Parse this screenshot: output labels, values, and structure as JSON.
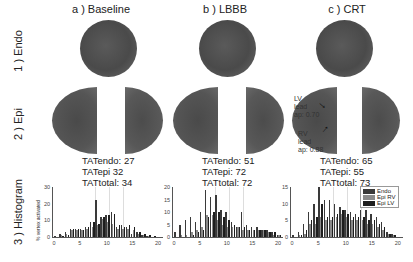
{
  "columns": [
    {
      "label": "a ) Baseline",
      "tat": {
        "endo": "TATendo: 27",
        "epi": "TATepi 32",
        "total": "TATtotal: 34"
      }
    },
    {
      "label": "b ) LBBB",
      "tat": {
        "endo": "TATendo: 51",
        "epi": "TATepi: 72",
        "total": "TATtotal: 72"
      }
    },
    {
      "label": "c ) CRT",
      "tat": {
        "endo": "TATendo: 65",
        "epi": "TATepi: 55",
        "total": "TATtotal: 73"
      }
    }
  ],
  "rows": [
    "1 ) Endo",
    "2 ) Epi",
    "3 ) Histogram"
  ],
  "annotations": {
    "lv": "LV\nlead\nap: 0.70",
    "rv": "RV\nlead\nap: 0.88"
  },
  "hist_ylabel": "% vertex activated",
  "legend": [
    {
      "name": "Endo",
      "color": "#3a3a3a"
    },
    {
      "name": "Epi RV",
      "color": "#8a8a8a"
    },
    {
      "name": "Epi LV",
      "color": "#1e1e1e"
    }
  ],
  "chart_data": [
    {
      "type": "bar",
      "title": "Baseline histogram",
      "xlabel": "",
      "ylabel": "% vertex activated",
      "x": [
        0,
        1,
        2,
        3,
        4,
        5,
        6,
        7,
        8,
        9,
        10,
        11,
        12,
        13,
        14,
        15,
        16,
        17,
        18,
        19,
        20
      ],
      "ylim": [
        0,
        30
      ],
      "yticks": [
        0,
        10,
        20,
        30
      ],
      "xticks": [
        0,
        5,
        10,
        15,
        20
      ],
      "series": [
        {
          "name": "Endo",
          "values": [
            0.5,
            2,
            3,
            5,
            5,
            5,
            6,
            9,
            22,
            12,
            13,
            15,
            6,
            7,
            6,
            2,
            3,
            1,
            0.5,
            0,
            0
          ]
        },
        {
          "name": "Epi RV",
          "values": [
            0,
            1,
            2,
            4,
            4,
            4,
            5,
            6,
            7,
            11,
            9,
            8,
            5,
            5,
            5,
            4,
            2,
            1,
            0.5,
            0,
            0
          ]
        },
        {
          "name": "Epi LV",
          "values": [
            0,
            0.5,
            1.5,
            5,
            5,
            4,
            6,
            9,
            8,
            12,
            13,
            14,
            7,
            6,
            7,
            6,
            3,
            2,
            1,
            0.5,
            0
          ]
        }
      ]
    },
    {
      "type": "bar",
      "title": "LBBB histogram",
      "xlabel": "",
      "ylabel": "% vertex activated",
      "x": [
        0,
        1,
        2,
        3,
        4,
        5,
        6,
        7,
        8,
        9,
        10,
        11,
        12,
        13,
        14,
        15,
        16,
        17,
        18,
        19,
        20
      ],
      "ylim": [
        0,
        20
      ],
      "yticks": [
        0,
        5,
        10,
        15,
        20
      ],
      "xticks": [
        0,
        5,
        10,
        15,
        20
      ],
      "series": [
        {
          "name": "Endo",
          "values": [
            2,
            5,
            7,
            8,
            6,
            10,
            19,
            16,
            17,
            11,
            10,
            6,
            4,
            10,
            5,
            4,
            4,
            3,
            3,
            2,
            1
          ]
        },
        {
          "name": "Epi RV",
          "values": [
            0,
            1,
            1,
            2,
            3,
            4,
            9,
            9,
            7,
            5,
            4,
            4,
            4,
            3,
            3,
            3,
            3,
            3,
            2,
            1,
            1
          ]
        },
        {
          "name": "Epi LV",
          "values": [
            0,
            0,
            0,
            1,
            2,
            3,
            8,
            10,
            10,
            8,
            7,
            5,
            4,
            4,
            3,
            3,
            3,
            3,
            2,
            2,
            1
          ]
        }
      ]
    },
    {
      "type": "bar",
      "title": "CRT histogram",
      "xlabel": "",
      "ylabel": "% vertex activated",
      "x": [
        0,
        1,
        2,
        3,
        4,
        5,
        6,
        7,
        8,
        9,
        10,
        11,
        12,
        13,
        14,
        15,
        16,
        17,
        18,
        19,
        20
      ],
      "ylim": [
        0,
        15
      ],
      "yticks": [
        0,
        5,
        10,
        15
      ],
      "xticks": [
        0,
        5,
        10,
        15,
        20
      ],
      "series": [
        {
          "name": "Endo",
          "values": [
            0.5,
            1.5,
            4,
            7.5,
            10,
            15,
            11,
            11,
            10,
            9,
            8,
            7.5,
            7,
            8,
            8,
            7,
            6,
            4.5,
            1.5,
            1,
            0
          ]
        },
        {
          "name": "Epi RV",
          "values": [
            0,
            0.5,
            1,
            4,
            4,
            6,
            5,
            5,
            6,
            7,
            6,
            5,
            5,
            5,
            4,
            4,
            3,
            2,
            1,
            0.5,
            0
          ]
        },
        {
          "name": "Epi LV",
          "values": [
            0,
            0.5,
            2,
            5,
            6,
            10,
            6,
            6,
            7,
            8,
            7,
            6,
            6,
            6,
            5,
            5,
            4,
            3,
            1,
            0.5,
            0
          ]
        }
      ]
    }
  ]
}
